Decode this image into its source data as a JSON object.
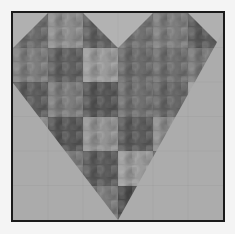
{
  "figure": {
    "grid": {
      "rows": 6,
      "cols": 6
    },
    "colors": {
      "page_background": "#f4f4f4",
      "frame_border": "#1a1a1a",
      "background_light": "#b4b4b4",
      "background_light_alt": "#a8a8a8"
    },
    "cells": [
      [
        "#6a6a6a",
        "#8c8c8c",
        "#5e5e5e",
        "#707070",
        "#7c7c7c",
        "#5a5a5a"
      ],
      [
        "#7d7d7d",
        "#5f5f5f",
        "#9a9a9a",
        "#6a6a6a",
        "#6e6e6e",
        "#777777"
      ],
      [
        "#5c5c5c",
        "#7c7c7c",
        "#555555",
        "#6f6f6f",
        "#666666",
        "#9a9a9a"
      ],
      [
        "#8a8a8a",
        "#555555",
        "#929292",
        "#5a5a5a",
        "#8a8a8a",
        "#666666"
      ],
      [
        "#a8a8a8",
        "#7a7a7a",
        "#5a5a5a",
        "#9a9a9a",
        "#606060",
        "#6a6a6a"
      ],
      [
        "#a8a8a8",
        "#a8a8a8",
        "#7a7a7a",
        "#4a4a4a",
        "#a8a8a8",
        "#a8a8a8"
      ]
    ],
    "top_triangles": [
      {
        "name": "top-left-corner",
        "points": "0,0 35.7,0 0,35.7",
        "color": "#b0b0b0"
      },
      {
        "name": "top-center-v",
        "points": "71.3,0 142.7,0 107,35.7",
        "color": "#b2b2b2"
      },
      {
        "name": "top-right-corner",
        "points": "178.3,0 214,0 214,35.7",
        "color": "#b0b0b0"
      }
    ],
    "bottom_triangles": [
      {
        "name": "bottom-left-background",
        "points": "0,71.3 0,211 107,211",
        "color": "#ababab"
      },
      {
        "name": "bottom-right-background",
        "points": "214,19 214,211 107,211",
        "color": "#acacac"
      }
    ]
  }
}
